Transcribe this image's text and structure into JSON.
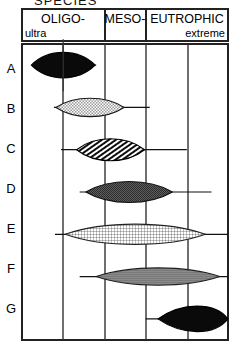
{
  "figure": {
    "top_clipped_label": "SPECIES",
    "header": {
      "columns": [
        {
          "main": "OLIGO-",
          "sub": "ultra",
          "main_align": "center",
          "sub_align": "left"
        },
        {
          "main": "MESO-",
          "sub": "",
          "main_align": "center",
          "sub_align": "center"
        },
        {
          "main": "EUTROPHIC",
          "sub": "extreme",
          "main_align": "center",
          "sub_align": "right"
        }
      ]
    },
    "row_labels": [
      "A",
      "B",
      "C",
      "D",
      "E",
      "F",
      "G"
    ],
    "colors": {
      "ink": "#000000",
      "frame": "#222222",
      "gridline": "#333333",
      "fill_solid": "#0a0a0a",
      "fill_light": "#c9c9c9",
      "fill_medium": "#8f8f8f",
      "fill_dark": "#5a5a5a",
      "background": "#ffffff"
    }
  },
  "chart_data": {
    "type": "area",
    "title": "SPECIES",
    "xlabel": "",
    "ylabel": "",
    "grid": true,
    "legend_position": "none",
    "axis_note": "Horizontal axis is a trophic-state gradient from ultra-oligotrophic (left) to extreme eutrophic (right); each row is a kite/lens diagram showing a taxon's abundance distribution along that gradient.",
    "x_categories": [
      "OLIGO-",
      "MESO-",
      "EUTROPHIC"
    ],
    "gridline_positions_px": [
      22,
      63,
      105,
      146,
      188,
      228
    ],
    "series": [
      {
        "name": "A",
        "fill": "solid-black",
        "center": 0.2,
        "half_width": 0.155,
        "peak": 1.0,
        "tail_right_to": 0.36,
        "tail_left_to": 0.055,
        "has_vertical_tick": true
      },
      {
        "name": "B",
        "fill": "light-stipple",
        "center": 0.33,
        "half_width": 0.165,
        "peak": 0.72,
        "tail_right_to": 0.62,
        "tail_left_to": 0.155
      },
      {
        "name": "C",
        "fill": "diagonal-hatch",
        "center": 0.43,
        "half_width": 0.165,
        "peak": 0.86,
        "tail_right_to": 0.8,
        "tail_left_to": 0.19
      },
      {
        "name": "D",
        "fill": "dark-stipple",
        "center": 0.52,
        "half_width": 0.21,
        "peak": 0.82,
        "tail_right_to": 0.92,
        "tail_left_to": 0.28
      },
      {
        "name": "E",
        "fill": "cross-hatch",
        "center": 0.55,
        "half_width": 0.34,
        "peak": 0.8,
        "tail_right_to": 1.02,
        "tail_left_to": 0.16
      },
      {
        "name": "F",
        "fill": "medium-gray",
        "center": 0.66,
        "half_width": 0.3,
        "peak": 0.68,
        "tail_right_to": 1.02,
        "tail_left_to": 0.28
      },
      {
        "name": "G",
        "fill": "solid-black",
        "center": 0.88,
        "half_width": 0.22,
        "peak": 1.0,
        "tail_right_to": 1.05,
        "tail_left_to": 0.6
      }
    ]
  }
}
